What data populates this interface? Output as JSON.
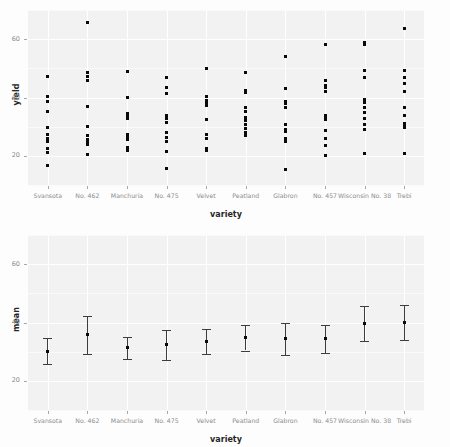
{
  "chart_data": [
    {
      "panel": "top",
      "type": "scatter",
      "title": "",
      "xlabel": "variety",
      "ylabel": "yield",
      "ylim": [
        10,
        70
      ],
      "yticks": [
        20,
        40,
        60
      ],
      "ytick_labels": [
        "20",
        "40",
        "60"
      ],
      "grid": true,
      "legend": "none",
      "categories": [
        "Svansota",
        "No. 462",
        "Manchuria",
        "No. 475",
        "Velvet",
        "Peatland",
        "Glabron",
        "No. 457",
        "Wisconsin No. 38",
        "Trebi"
      ],
      "series": [
        {
          "name": "Svansota",
          "values": [
            47.3,
            40.5,
            38.5,
            35.1,
            29.7,
            27.4,
            26.1,
            24.9,
            22.6,
            21.1,
            16.6
          ]
        },
        {
          "name": "No. 462",
          "values": [
            65.8,
            48.6,
            47.2,
            45.7,
            37.0,
            30.0,
            27.1,
            25.7,
            24.7,
            23.8,
            20.6
          ]
        },
        {
          "name": "Manchuria",
          "values": [
            48.9,
            40.0,
            34.4,
            33.5,
            32.9,
            27.4,
            26.2,
            25.5,
            22.8,
            22.0
          ]
        },
        {
          "name": "No. 475",
          "values": [
            46.8,
            43.6,
            41.5,
            33.8,
            32.8,
            31.5,
            28.1,
            26.4,
            24.9,
            21.4,
            15.7
          ]
        },
        {
          "name": "Velvet",
          "values": [
            49.9,
            40.5,
            39.1,
            38.1,
            37.4,
            32.5,
            27.4,
            25.9,
            22.6,
            21.9
          ]
        },
        {
          "name": "Peatland",
          "values": [
            48.6,
            42.4,
            41.8,
            36.6,
            35.1,
            33.1,
            32.8,
            32.0,
            30.8,
            29.3,
            28.1,
            27.0
          ]
        },
        {
          "name": "Glabron",
          "values": [
            54.0,
            43.2,
            38.8,
            37.9,
            36.6,
            30.7,
            29.1,
            28.5,
            25.9,
            24.9,
            15.2
          ]
        },
        {
          "name": "No. 457",
          "values": [
            58.2,
            45.7,
            44.1,
            43.3,
            42.2,
            34.0,
            33.1,
            32.4,
            28.6,
            26.1,
            23.5,
            20.1
          ]
        },
        {
          "name": "Wisconsin No. 38",
          "values": [
            58.8,
            58.2,
            49.2,
            46.8,
            39.3,
            38.3,
            36.6,
            34.7,
            32.8,
            30.7,
            29.2,
            20.8
          ]
        },
        {
          "name": "Trebi",
          "values": [
            63.8,
            49.2,
            46.9,
            44.8,
            42.2,
            36.6,
            34.0,
            31.0,
            30.7,
            29.8,
            20.7
          ]
        }
      ]
    },
    {
      "panel": "bottom",
      "type": "errorbar",
      "title": "",
      "xlabel": "variety",
      "ylabel": "mean",
      "ylim": [
        10,
        70
      ],
      "yticks": [
        20,
        40,
        60
      ],
      "ytick_labels": [
        "20",
        "40",
        "60"
      ],
      "grid": true,
      "legend": "none",
      "categories": [
        "Svansota",
        "No. 462",
        "Manchuria",
        "No. 475",
        "Velvet",
        "Peatland",
        "Glabron",
        "No. 457",
        "Wisconsin No. 38",
        "Trebi"
      ],
      "values": [
        30.2,
        35.8,
        31.3,
        32.4,
        33.5,
        34.7,
        34.4,
        34.4,
        39.7,
        39.9
      ],
      "lower": [
        25.8,
        29.2,
        27.5,
        27.3,
        29.3,
        30.4,
        29.0,
        29.5,
        33.7,
        33.9
      ],
      "upper": [
        34.6,
        42.4,
        35.1,
        37.5,
        37.7,
        39.0,
        39.8,
        39.3,
        45.7,
        45.9
      ]
    }
  ],
  "axes": {
    "top": {
      "y_title": "yield",
      "x_title": "variety"
    },
    "bottom": {
      "y_title": "mean",
      "x_title": "variety"
    }
  },
  "colors": {
    "panel_background": "#f2f2f2",
    "page_background": "#fdfdfd",
    "gridline": "#ffffff",
    "point": "#0a0a0a",
    "errorbar": "#3d3d3d",
    "tick_text": "#8c8c8c",
    "axis_title_text": "#262626"
  }
}
